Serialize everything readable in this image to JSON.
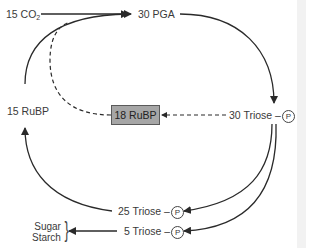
{
  "diagram": {
    "nodes": {
      "co2": {
        "count": "15",
        "label": "CO",
        "subscript": "2"
      },
      "pga": {
        "label": "30 PGA"
      },
      "triose_30": {
        "label": "30 Triose –",
        "phosphate": "P"
      },
      "triose_25": {
        "label": "25 Triose –",
        "phosphate": "P"
      },
      "triose_5": {
        "label": "5 Triose –",
        "phosphate": "P"
      },
      "rubp_15": {
        "label": "15 RuBP"
      },
      "rubp_pool": {
        "label": "18 RuBP"
      },
      "products": {
        "line1": "Sugar",
        "line2": "Starch"
      }
    },
    "edges": [
      {
        "from": "15 CO2",
        "to": "30 PGA",
        "style": "solid"
      },
      {
        "from": "30 PGA",
        "to": "30 Triose-P",
        "style": "solid"
      },
      {
        "from": "30 Triose-P",
        "to": "25 Triose-P",
        "style": "solid"
      },
      {
        "from": "30 Triose-P",
        "to": "5 Triose-P",
        "style": "solid"
      },
      {
        "from": "25 Triose-P",
        "to": "15 RuBP",
        "style": "solid"
      },
      {
        "from": "15 RuBP",
        "to": "30 PGA",
        "style": "solid"
      },
      {
        "from": "5 Triose-P",
        "to": "Sugar/Starch",
        "style": "solid"
      },
      {
        "from": "30 Triose-P",
        "to": "18 RuBP",
        "style": "dashed"
      },
      {
        "from": "18 RuBP",
        "to": "30 PGA",
        "style": "dashed"
      }
    ],
    "colors": {
      "line": "#2a2a2a",
      "pool_fill": "#a6a6a6",
      "pool_border": "#5a5a5a",
      "text": "#3a3a3a"
    }
  }
}
